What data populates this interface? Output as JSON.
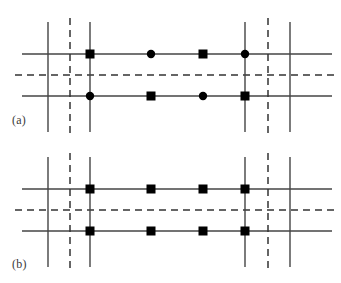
{
  "figure": {
    "width": 341,
    "height": 283,
    "background": "#ffffff",
    "line_color": "#444444",
    "dashed_color": "#333333",
    "node_color": "#000000"
  },
  "panels": [
    {
      "id": "panel-a",
      "label": "(a)",
      "label_x": 12,
      "label_y": 114,
      "top": 0,
      "height": 141,
      "horizontal_lines": [
        {
          "type": "solid",
          "y": 54,
          "x1": 22,
          "x2": 332
        },
        {
          "type": "dashed",
          "y": 75,
          "x1": 15,
          "x2": 336
        },
        {
          "type": "solid",
          "y": 96,
          "x1": 22,
          "x2": 332
        }
      ],
      "vertical_lines": [
        {
          "type": "solid",
          "x": 48,
          "y1": 22,
          "y2": 132
        },
        {
          "type": "dashed",
          "x": 70,
          "y1": 18,
          "y2": 136
        },
        {
          "type": "solid",
          "x": 90,
          "y1": 22,
          "y2": 132
        },
        {
          "type": "solid",
          "x": 245,
          "y1": 22,
          "y2": 132
        },
        {
          "type": "dashed",
          "x": 268,
          "y1": 18,
          "y2": 136
        },
        {
          "type": "solid",
          "x": 290,
          "y1": 22,
          "y2": 132
        }
      ],
      "nodes": [
        {
          "shape": "square",
          "x": 90,
          "y": 54
        },
        {
          "shape": "circle",
          "x": 151,
          "y": 54
        },
        {
          "shape": "square",
          "x": 203,
          "y": 54
        },
        {
          "shape": "circle",
          "x": 245,
          "y": 54
        },
        {
          "shape": "circle",
          "x": 90,
          "y": 96
        },
        {
          "shape": "square",
          "x": 151,
          "y": 96
        },
        {
          "shape": "circle",
          "x": 203,
          "y": 96
        },
        {
          "shape": "square",
          "x": 245,
          "y": 96
        }
      ]
    },
    {
      "id": "panel-b",
      "label": "(b)",
      "label_x": 12,
      "label_y": 258,
      "top": 141,
      "height": 142,
      "horizontal_lines": [
        {
          "type": "solid",
          "y": 189,
          "x1": 22,
          "x2": 332
        },
        {
          "type": "dashed",
          "y": 210,
          "x1": 15,
          "x2": 336
        },
        {
          "type": "solid",
          "y": 231,
          "x1": 22,
          "x2": 332
        }
      ],
      "vertical_lines": [
        {
          "type": "solid",
          "x": 48,
          "y1": 157,
          "y2": 267
        },
        {
          "type": "dashed",
          "x": 70,
          "y1": 153,
          "y2": 271
        },
        {
          "type": "solid",
          "x": 90,
          "y1": 157,
          "y2": 267
        },
        {
          "type": "solid",
          "x": 245,
          "y1": 157,
          "y2": 267
        },
        {
          "type": "dashed",
          "x": 268,
          "y1": 153,
          "y2": 271
        },
        {
          "type": "solid",
          "x": 290,
          "y1": 157,
          "y2": 267
        }
      ],
      "nodes": [
        {
          "shape": "square",
          "x": 90,
          "y": 189
        },
        {
          "shape": "square",
          "x": 151,
          "y": 189
        },
        {
          "shape": "square",
          "x": 203,
          "y": 189
        },
        {
          "shape": "square",
          "x": 245,
          "y": 189
        },
        {
          "shape": "square",
          "x": 90,
          "y": 231
        },
        {
          "shape": "square",
          "x": 151,
          "y": 231
        },
        {
          "shape": "square",
          "x": 203,
          "y": 231
        },
        {
          "shape": "square",
          "x": 245,
          "y": 231
        }
      ]
    }
  ],
  "marker_sizes": {
    "square_side": 9,
    "circle_radius": 4.2
  }
}
